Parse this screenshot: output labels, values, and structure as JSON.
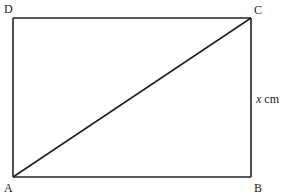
{
  "diagram": {
    "type": "geometry-rectangle-with-diagonal",
    "shape": "rectangle",
    "vertices": [
      {
        "name": "A",
        "position": "bottom-left"
      },
      {
        "name": "B",
        "position": "bottom-right"
      },
      {
        "name": "C",
        "position": "top-right"
      },
      {
        "name": "D",
        "position": "top-left"
      }
    ],
    "edges": [
      {
        "from": "A",
        "to": "B"
      },
      {
        "from": "B",
        "to": "C"
      },
      {
        "from": "C",
        "to": "D"
      },
      {
        "from": "D",
        "to": "A"
      }
    ],
    "diagonal": {
      "from": "A",
      "to": "C"
    },
    "side_label": {
      "side": "BC",
      "variable": "x",
      "unit": "cm"
    },
    "line_color": "#222222"
  },
  "labels": {
    "A": "A",
    "B": "B",
    "C": "C",
    "D": "D",
    "bc_variable": "x",
    "bc_unit": " cm"
  }
}
